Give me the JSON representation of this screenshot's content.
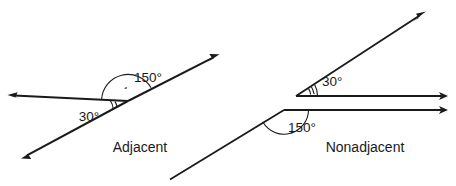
{
  "figure": {
    "stroke_color": "#1a1a1a",
    "background_color": "#ffffff",
    "width": 456,
    "height": 186
  },
  "diagrams": [
    {
      "id": "adjacent",
      "caption": "Adjacent",
      "caption_pos": {
        "x": 140,
        "y": 152
      },
      "vertex": {
        "x": 128,
        "y": 101
      },
      "angles": [
        {
          "id": "adjacent-150",
          "label": "150°",
          "value": 150,
          "unit": "degrees",
          "label_pos": {
            "x": 148,
            "y": 77
          },
          "arc_radius": 26,
          "arc_start_deg": 152,
          "arc_end_deg": 2,
          "tick_count": 1
        },
        {
          "id": "adjacent-30",
          "label": "30°",
          "value": 30,
          "unit": "degrees",
          "label_pos": {
            "x": 89,
            "y": 116
          },
          "arc_radius": 17,
          "arc_start_deg": 208,
          "arc_end_deg": 180,
          "tick_count": 2
        }
      ],
      "rays": [
        {
          "id": "adjacent-upper-right-ray",
          "from": {
            "x": 128,
            "y": 101
          },
          "to": {
            "x": 218,
            "y": 55
          },
          "arrow": "end",
          "width": 2.0
        },
        {
          "id": "adjacent-lower-left-ray",
          "from": {
            "x": 128,
            "y": 101
          },
          "to": {
            "x": 22,
            "y": 158
          },
          "arrow": "end",
          "width": 2.0
        },
        {
          "id": "adjacent-left-horizontal-ray",
          "from": {
            "x": 128,
            "y": 101
          },
          "to": {
            "x": 8,
            "y": 95
          },
          "arrow": "end",
          "width": 2.0
        }
      ]
    },
    {
      "id": "nonadjacent",
      "caption": "Nonadjacent",
      "caption_pos": {
        "x": 365,
        "y": 152
      },
      "angles": [
        {
          "id": "nonadjacent-30",
          "label": "30°",
          "value": 30,
          "unit": "degrees",
          "vertex": {
            "x": 296,
            "y": 96
          },
          "label_pos": {
            "x": 322,
            "y": 81
          },
          "arc_radius": 22,
          "arc_start_deg": 330,
          "arc_end_deg": 360,
          "tick_count": 2
        },
        {
          "id": "nonadjacent-150",
          "label": "150°",
          "value": 150,
          "unit": "degrees",
          "vertex": {
            "x": 284,
            "y": 110
          },
          "label_pos": {
            "x": 302,
            "y": 127
          },
          "arc_radius": 24,
          "arc_start_deg": 0,
          "arc_end_deg": 150,
          "tick_count": 1
        }
      ],
      "rays": [
        {
          "id": "nonadjacent-upper-diagonal-ray",
          "from": {
            "x": 296,
            "y": 96
          },
          "to": {
            "x": 425,
            "y": 12
          },
          "arrow": "end",
          "width": 1.8
        },
        {
          "id": "nonadjacent-upper-horizontal-ray",
          "from": {
            "x": 296,
            "y": 96
          },
          "to": {
            "x": 447,
            "y": 96
          },
          "arrow": "end",
          "width": 1.8
        },
        {
          "id": "nonadjacent-lower-horizontal-ray",
          "from": {
            "x": 284,
            "y": 110
          },
          "to": {
            "x": 447,
            "y": 110
          },
          "arrow": "end",
          "width": 1.8
        },
        {
          "id": "nonadjacent-lower-diagonal-ray",
          "from": {
            "x": 284,
            "y": 110
          },
          "to": {
            "x": 172,
            "y": 178
          },
          "arrow": "none",
          "width": 1.8
        }
      ]
    }
  ]
}
